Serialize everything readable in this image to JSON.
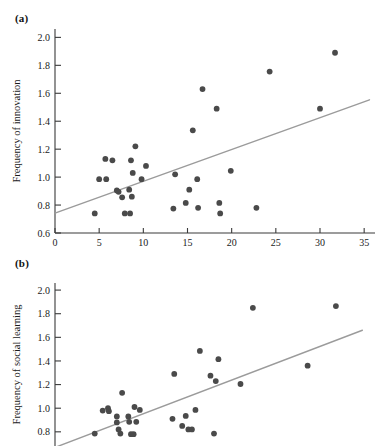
{
  "figure": {
    "panels": [
      {
        "key": "a",
        "label": "(a)"
      },
      {
        "key": "b",
        "label": "(b)"
      }
    ]
  },
  "chart_data": [
    {
      "type": "scatter",
      "panel": "(a)",
      "title": "",
      "xlabel": "Executive brain ratio",
      "ylabel": "Frequency of innovation",
      "xlim": [
        0,
        36
      ],
      "ylim": [
        0.6,
        2.06
      ],
      "xticks": [
        0,
        5,
        10,
        15,
        20,
        25,
        30,
        35
      ],
      "xticklabels": [
        "0",
        "5",
        "10",
        "15",
        "20",
        "25",
        "30",
        "35"
      ],
      "yticks": [
        0.6,
        0.8,
        1.0,
        1.2,
        1.4,
        1.6,
        1.8,
        2.0
      ],
      "yticklabels": [
        "0.6",
        "0.8",
        "1.0",
        "1.2",
        "1.4",
        "1.6",
        "1.8",
        "2.0"
      ],
      "grid": false,
      "legend": false,
      "point_color": "#4a4a4a",
      "trend_color": "#9b9b9b",
      "points": [
        {
          "x": 4.5,
          "y": 0.74
        },
        {
          "x": 5.0,
          "y": 0.985
        },
        {
          "x": 5.8,
          "y": 0.985
        },
        {
          "x": 5.7,
          "y": 1.13
        },
        {
          "x": 6.5,
          "y": 1.12
        },
        {
          "x": 7.0,
          "y": 0.905
        },
        {
          "x": 7.2,
          "y": 0.895
        },
        {
          "x": 7.6,
          "y": 0.855
        },
        {
          "x": 7.9,
          "y": 0.74
        },
        {
          "x": 8.5,
          "y": 0.74
        },
        {
          "x": 8.4,
          "y": 0.91
        },
        {
          "x": 8.7,
          "y": 0.86
        },
        {
          "x": 8.6,
          "y": 1.12
        },
        {
          "x": 8.8,
          "y": 1.03
        },
        {
          "x": 9.1,
          "y": 1.22
        },
        {
          "x": 9.8,
          "y": 0.985
        },
        {
          "x": 10.3,
          "y": 1.08
        },
        {
          "x": 13.4,
          "y": 0.775
        },
        {
          "x": 13.6,
          "y": 1.02
        },
        {
          "x": 14.8,
          "y": 0.815
        },
        {
          "x": 15.2,
          "y": 0.91
        },
        {
          "x": 15.6,
          "y": 1.335
        },
        {
          "x": 16.1,
          "y": 0.985
        },
        {
          "x": 16.2,
          "y": 0.78
        },
        {
          "x": 16.7,
          "y": 1.63
        },
        {
          "x": 18.3,
          "y": 1.49
        },
        {
          "x": 18.6,
          "y": 0.815
        },
        {
          "x": 18.7,
          "y": 0.74
        },
        {
          "x": 19.9,
          "y": 1.045
        },
        {
          "x": 22.8,
          "y": 0.78
        },
        {
          "x": 24.3,
          "y": 1.755
        },
        {
          "x": 30.0,
          "y": 1.49
        },
        {
          "x": 31.7,
          "y": 1.89
        }
      ],
      "trend": {
        "x1": 0.0,
        "y1": 0.742,
        "x2": 35.6,
        "y2": 1.553
      }
    },
    {
      "type": "scatter",
      "panel": "(b)",
      "title": "",
      "xlabel": "",
      "ylabel": "Frequency of social learning",
      "xlim": [
        0,
        36
      ],
      "ylim": [
        0.68,
        2.06
      ],
      "xticks": [],
      "xticklabels": [],
      "yticks": [
        0.8,
        1.0,
        1.2,
        1.4,
        1.6,
        1.8,
        2.0
      ],
      "yticklabels": [
        "0.8",
        "1.0",
        "1.2",
        "1.4",
        "1.6",
        "1.8",
        "2.0"
      ],
      "grid": false,
      "legend": false,
      "point_color": "#4a4a4a",
      "trend_color": "#9b9b9b",
      "points": [
        {
          "x": 4.5,
          "y": 0.785
        },
        {
          "x": 5.4,
          "y": 0.98
        },
        {
          "x": 6.0,
          "y": 1.0
        },
        {
          "x": 6.1,
          "y": 0.975
        },
        {
          "x": 7.0,
          "y": 0.93
        },
        {
          "x": 7.0,
          "y": 0.88
        },
        {
          "x": 7.2,
          "y": 0.82
        },
        {
          "x": 7.4,
          "y": 0.785
        },
        {
          "x": 7.6,
          "y": 1.13
        },
        {
          "x": 8.3,
          "y": 0.93
        },
        {
          "x": 8.4,
          "y": 0.885
        },
        {
          "x": 8.6,
          "y": 0.78
        },
        {
          "x": 8.9,
          "y": 0.78
        },
        {
          "x": 9.0,
          "y": 1.01
        },
        {
          "x": 9.2,
          "y": 0.885
        },
        {
          "x": 9.6,
          "y": 0.985
        },
        {
          "x": 13.3,
          "y": 0.91
        },
        {
          "x": 13.5,
          "y": 1.29
        },
        {
          "x": 14.4,
          "y": 0.85
        },
        {
          "x": 14.8,
          "y": 0.935
        },
        {
          "x": 15.1,
          "y": 0.82
        },
        {
          "x": 15.5,
          "y": 0.82
        },
        {
          "x": 15.9,
          "y": 0.985
        },
        {
          "x": 16.4,
          "y": 1.485
        },
        {
          "x": 17.6,
          "y": 1.275
        },
        {
          "x": 18.0,
          "y": 0.785
        },
        {
          "x": 18.2,
          "y": 1.23
        },
        {
          "x": 18.5,
          "y": 1.415
        },
        {
          "x": 21.0,
          "y": 1.205
        },
        {
          "x": 22.4,
          "y": 1.85
        },
        {
          "x": 28.6,
          "y": 1.36
        },
        {
          "x": 31.8,
          "y": 1.865
        }
      ],
      "trend": {
        "x1": 0.0,
        "y1": 0.668,
        "x2": 34.8,
        "y2": 1.66
      }
    }
  ]
}
